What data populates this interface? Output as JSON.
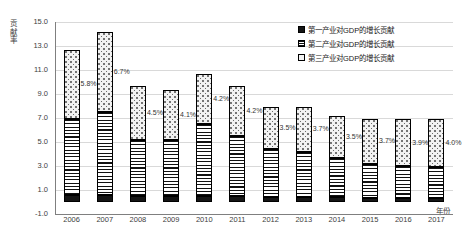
{
  "chart_data": {
    "type": "bar",
    "stacked": true,
    "title": "",
    "xlabel": "年份",
    "ylabel": "贡献率",
    "ylim": [
      -1.0,
      15.0
    ],
    "ytick_step": 2.0,
    "yticks": [
      "15.0",
      "13.0",
      "11.0",
      "9.0",
      "7.0",
      "5.0",
      "3.0",
      "1.0",
      "-1.0"
    ],
    "ytick_values": [
      15.0,
      13.0,
      11.0,
      9.0,
      7.0,
      5.0,
      3.0,
      1.0,
      -1.0
    ],
    "grid": true,
    "legend_position": "top-right",
    "categories": [
      "2006",
      "2007",
      "2008",
      "2009",
      "2010",
      "2011",
      "2012",
      "2013",
      "2014",
      "2015",
      "2016",
      "2017"
    ],
    "series": [
      {
        "name": "第一产业对GDP的增长贡献",
        "key": "primary",
        "values": [
          0.6,
          0.6,
          0.5,
          0.5,
          0.5,
          0.5,
          0.4,
          0.4,
          0.4,
          0.3,
          0.3,
          0.3
        ]
      },
      {
        "name": "第二产业对GDP的增长贡献",
        "key": "secondary",
        "values": [
          6.3,
          6.9,
          4.7,
          4.7,
          6.0,
          5.0,
          4.0,
          3.8,
          3.3,
          2.9,
          2.7,
          2.6
        ]
      },
      {
        "name": "第三产业对GDP的增长贡献",
        "key": "tertiary",
        "values": [
          5.8,
          6.7,
          4.5,
          4.1,
          4.2,
          4.2,
          3.5,
          3.7,
          3.5,
          3.7,
          3.9,
          4.0
        ]
      }
    ],
    "totals": [
      12.7,
      14.2,
      9.7,
      9.4,
      10.7,
      9.5,
      8.1,
      8.1,
      7.4,
      7.0,
      7.0,
      7.0
    ],
    "data_labels": [
      "5.8%",
      "6.7%",
      "4.5%",
      "4.1%",
      "4.2%",
      "4.2%",
      "3.5%",
      "3.7%",
      "3.5%",
      "3.7%",
      "3.9%",
      "4.0%"
    ],
    "data_label_note": "labels annotate the third (tertiary) series segment of each stacked bar",
    "colors": {
      "primary_fill": "#151515",
      "secondary_fill": "#ffffff",
      "secondary_pattern": "horizontal-lines",
      "tertiary_fill": "#f2f2f2",
      "tertiary_pattern": "dots",
      "gridline": "#d9d9d9",
      "axis": "#7f7f7f",
      "text": "#404040"
    }
  },
  "legend": {
    "items": [
      {
        "label": "第一产业对GDP的增长贡献",
        "swatch": "swatch-solid-black-icon"
      },
      {
        "label": "第二产业对GDP的增长贡献",
        "swatch": "swatch-horizontal-lines-icon"
      },
      {
        "label": "第三产业对GDP的增长贡献",
        "swatch": "swatch-dots-icon"
      }
    ]
  }
}
